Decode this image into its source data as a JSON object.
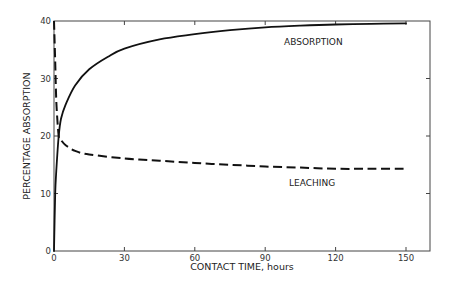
{
  "chart_data": {
    "type": "line",
    "title": "",
    "xlabel": "CONTACT TIME, hours",
    "ylabel": "PERCENTAGE ABSORPTION",
    "xlim": [
      0,
      160
    ],
    "ylim": [
      0,
      40
    ],
    "x_ticks": [
      0,
      30,
      60,
      90,
      120,
      150
    ],
    "y_ticks": [
      0,
      10,
      20,
      30,
      40
    ],
    "grid": false,
    "legend": "inline labels on curves",
    "series": [
      {
        "name": "ABSORPTION",
        "style": "solid",
        "x": [
          0,
          0.5,
          1,
          2,
          3,
          5,
          9,
          15,
          23,
          30,
          45,
          60,
          75,
          90,
          105,
          120,
          135,
          150
        ],
        "values": [
          0,
          10,
          14,
          20,
          23,
          25.5,
          28.8,
          31.6,
          33.8,
          35.2,
          36.8,
          37.7,
          38.4,
          38.9,
          39.2,
          39.4,
          39.5,
          39.6
        ]
      },
      {
        "name": "LEACHING",
        "style": "dashed",
        "x": [
          0,
          0.5,
          1,
          2,
          3,
          5,
          9,
          15,
          30,
          45,
          60,
          75,
          90,
          105,
          120,
          135,
          150
        ],
        "values": [
          40,
          33,
          26,
          20,
          19.3,
          18.4,
          17.4,
          16.8,
          16.1,
          15.7,
          15.3,
          15.0,
          14.7,
          14.5,
          14.3,
          14.3,
          14.3
        ]
      }
    ],
    "annotations": [
      {
        "text": "ABSORPTION",
        "x": 97,
        "y": 36.2
      },
      {
        "text": "LEACHING",
        "x": 97,
        "y": 12.1
      }
    ]
  },
  "labels": {
    "x_ticks": [
      "0",
      "30",
      "60",
      "90",
      "120",
      "150"
    ],
    "y_ticks": [
      "0",
      "10",
      "20",
      "30",
      "40"
    ],
    "xlabel": "CONTACT TIME, hours",
    "ylabel": "PERCENTAGE ABSORPTION",
    "absorption": "ABSORPTION",
    "leaching": "LEACHING"
  }
}
